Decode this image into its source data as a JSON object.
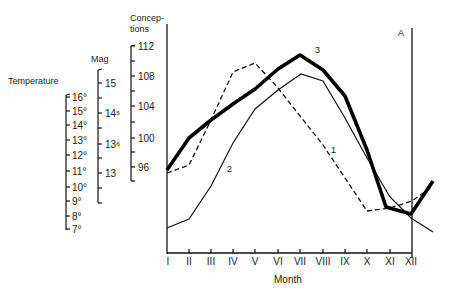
{
  "chart_data": {
    "type": "line",
    "title": "",
    "xlabel": "Month",
    "categories": [
      "I",
      "II",
      "III",
      "IV",
      "V",
      "VI",
      "VII",
      "VIII",
      "IX",
      "X",
      "XI",
      "XII"
    ],
    "annotation": "A",
    "axes": [
      {
        "name": "Temperature",
        "ticks": [
          "16°",
          "15°",
          "14°",
          "13°",
          "12°",
          "11°",
          "10°",
          "9°",
          "8°",
          "7°"
        ],
        "range": [
          7,
          16
        ]
      },
      {
        "name": "Mag",
        "ticks": [
          "15",
          "14⁵",
          "13⁶",
          "13"
        ]
      },
      {
        "name": "Concep-\ntions",
        "ticks": [
          "112",
          "108",
          "104",
          "100",
          "96"
        ],
        "range": [
          95,
          112
        ]
      }
    ],
    "series": [
      {
        "name": "1",
        "style": "dashed",
        "unit_axis": "Temperature",
        "values": [
          95.4,
          96.4,
          102.5,
          108.6,
          109.7,
          103.6,
          99.0,
          95.0,
          89.5,
          89.8,
          90.7,
          91.8
        ]
      },
      {
        "name": "2",
        "style": "thin",
        "unit_axis": "Mag",
        "values": [
          88.5,
          89.7,
          94.0,
          98.5,
          103.5,
          106.0,
          108.3,
          107.6,
          101.5,
          96.5,
          90.8,
          88.7
        ]
      },
      {
        "name": "3",
        "style": "thick",
        "unit_axis": "Conceptions",
        "values": [
          95.7,
          99.7,
          102.1,
          104.4,
          106.4,
          109.1,
          110.7,
          109.5,
          105.5,
          98.1,
          90.4,
          89.6
        ]
      }
    ],
    "grid": false,
    "legend": "inline labels 1, 2, 3"
  },
  "labels": {
    "temperature": "Temperature",
    "mag": "Mag",
    "conceptions_1": "Concep-",
    "conceptions_2": "tions",
    "x_axis": "Month",
    "marker_a": "A",
    "series_1": "1",
    "series_2": "2",
    "series_3": "3"
  },
  "temperature_ticks": [
    "16°",
    "15°",
    "14°",
    "13°",
    "12°",
    "11°",
    "10°",
    "9°",
    "8°",
    "7°"
  ],
  "mag_ticks": [
    "15",
    "14⁵",
    "13⁶",
    "13"
  ],
  "conceptions_ticks": [
    "112",
    "108",
    "104",
    "100",
    "96"
  ],
  "months": [
    "I",
    "II",
    "III",
    "IV",
    "V",
    "VI",
    "VII",
    "VIII",
    "IX",
    "X",
    "XI",
    "XII"
  ]
}
